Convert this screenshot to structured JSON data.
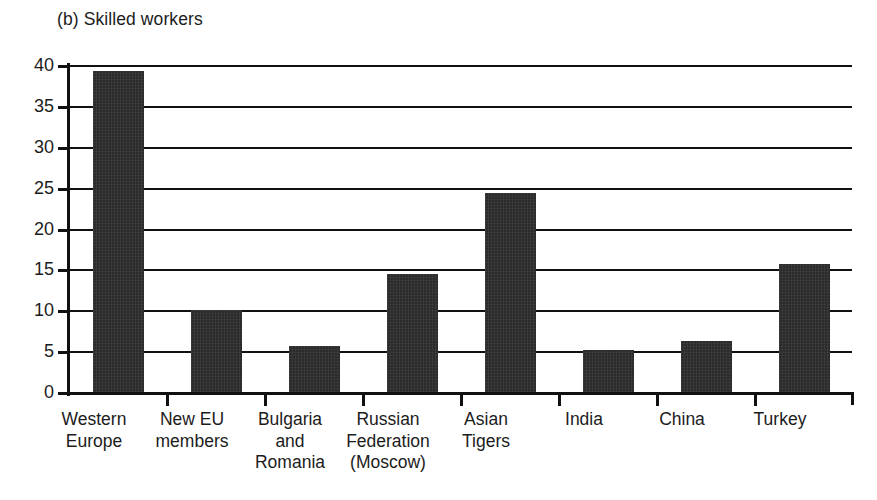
{
  "chart_data": {
    "type": "bar",
    "title": "(b) Skilled workers",
    "xlabel": "",
    "ylabel": "",
    "ylim": [
      0,
      40
    ],
    "yticks": [
      0,
      5,
      10,
      15,
      20,
      25,
      30,
      35,
      40
    ],
    "ytick_labels": [
      "0",
      "5",
      "10",
      "15",
      "20",
      "25",
      "30",
      "35",
      "40"
    ],
    "grid": true,
    "legend": false,
    "bar_color": "#2b2b2b",
    "categories": [
      "Western Europe",
      "New EU members",
      "Bulgaria and Romania",
      "Russian Federation (Moscow)",
      "Asian Tigers",
      "India",
      "China",
      "Turkey"
    ],
    "category_lines": [
      [
        "Western",
        "Europe"
      ],
      [
        "New EU",
        "members"
      ],
      [
        "Bulgaria",
        "and",
        "Romania"
      ],
      [
        "Russian",
        "Federation",
        "(Moscow)"
      ],
      [
        "Asian",
        "Tigers"
      ],
      [
        "India"
      ],
      [
        "China"
      ],
      [
        "Turkey"
      ]
    ],
    "values": [
      39.3,
      10.0,
      5.6,
      14.4,
      24.4,
      5.2,
      6.2,
      15.7
    ]
  }
}
